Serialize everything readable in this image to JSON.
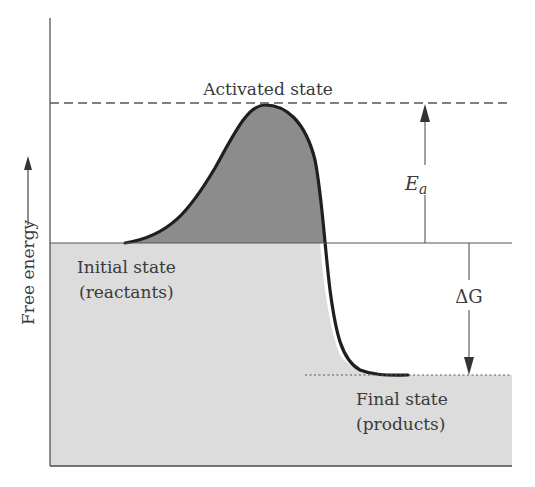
{
  "diagram": {
    "type": "free-energy reaction coordinate diagram",
    "y_axis_label": "Free energy",
    "labels": {
      "activated": "Activated state",
      "initial_line1": "Initial state",
      "initial_line2": "(reactants)",
      "final_line1": "Final state",
      "final_line2": "(products)",
      "ea_main": "E",
      "ea_sub": "a",
      "dg": "ΔG"
    },
    "levels": {
      "activated_y": 103,
      "initial_y": 243,
      "final_y": 375,
      "bottom_y": 465
    },
    "colors": {
      "barrier_fill": "#8c8c8c",
      "region_fill": "#dcdcdc",
      "curve": "#1f1f1f",
      "line": "#555555",
      "text": "#3a3a3a"
    }
  }
}
